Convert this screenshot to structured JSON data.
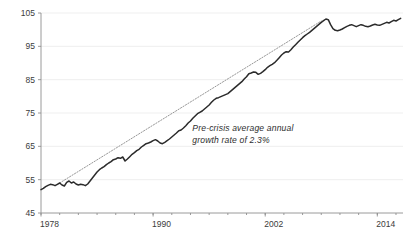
{
  "chart_data": {
    "type": "line",
    "title": "",
    "subtitle": "",
    "xlabel": "",
    "ylabel": "",
    "xlim": [
      1978,
      2016.75
    ],
    "ylim": [
      45,
      105
    ],
    "y_ticks": [
      45,
      55,
      65,
      75,
      85,
      95,
      105
    ],
    "y_tick_labels": [
      "45",
      "55",
      "65",
      "75",
      "85",
      "95",
      "105"
    ],
    "x_ticks": [
      1978,
      1990,
      2002,
      2014
    ],
    "x_tick_labels": [
      "1978",
      "1990",
      "2002",
      "2014"
    ],
    "x_minor_tick_interval": 2,
    "grid": "horizontal-faint",
    "legend": "none",
    "annotations": [
      {
        "name": "pre-crisis-trend-annotation",
        "line1": "Pre-crisis average annual",
        "line2": "growth rate of 2.3%",
        "x": 1994.2,
        "y": 69.5,
        "style": "italic"
      }
    ],
    "colors": {
      "series": "#2b2b2b",
      "trend": "#8a8a8a",
      "axis": "#8e8e8e",
      "grid": "#e8e8e8",
      "text": "#3b3b3b",
      "background": "#ffffff"
    },
    "series": [
      {
        "name": "index-series",
        "style": "solid",
        "color": "#2b2b2b",
        "x": [
          1978.0,
          1978.25,
          1978.5,
          1978.75,
          1979.0,
          1979.25,
          1979.5,
          1979.75,
          1980.0,
          1980.25,
          1980.5,
          1980.75,
          1981.0,
          1981.25,
          1981.5,
          1981.75,
          1982.0,
          1982.25,
          1982.5,
          1982.75,
          1983.0,
          1983.25,
          1983.5,
          1983.75,
          1984.0,
          1984.25,
          1984.5,
          1984.75,
          1985.0,
          1985.25,
          1985.5,
          1985.75,
          1986.0,
          1986.25,
          1986.5,
          1986.75,
          1987.0,
          1987.25,
          1987.5,
          1987.75,
          1988.0,
          1988.25,
          1988.5,
          1988.75,
          1989.0,
          1989.25,
          1989.5,
          1989.75,
          1990.0,
          1990.25,
          1990.5,
          1990.75,
          1991.0,
          1991.25,
          1991.5,
          1991.75,
          1992.0,
          1992.25,
          1992.5,
          1992.75,
          1993.0,
          1993.25,
          1993.5,
          1993.75,
          1994.0,
          1994.25,
          1994.5,
          1994.75,
          1995.0,
          1995.25,
          1995.5,
          1995.75,
          1996.0,
          1996.25,
          1996.5,
          1996.75,
          1997.0,
          1997.25,
          1997.5,
          1997.75,
          1998.0,
          1998.25,
          1998.5,
          1998.75,
          1999.0,
          1999.25,
          1999.5,
          1999.75,
          2000.0,
          2000.25,
          2000.5,
          2000.75,
          2001.0,
          2001.25,
          2001.5,
          2001.75,
          2002.0,
          2002.25,
          2002.5,
          2002.75,
          2003.0,
          2003.25,
          2003.5,
          2003.75,
          2004.0,
          2004.25,
          2004.5,
          2004.75,
          2005.0,
          2005.25,
          2005.5,
          2005.75,
          2006.0,
          2006.25,
          2006.5,
          2006.75,
          2007.0,
          2007.25,
          2007.5,
          2007.75,
          2008.0,
          2008.25,
          2008.5,
          2008.75,
          2009.0,
          2009.25,
          2009.5,
          2009.75,
          2010.0,
          2010.25,
          2010.5,
          2010.75,
          2011.0,
          2011.25,
          2011.5,
          2011.75,
          2012.0,
          2012.25,
          2012.5,
          2012.75,
          2013.0,
          2013.25,
          2013.5,
          2013.75,
          2014.0,
          2014.25,
          2014.5,
          2014.75,
          2015.0,
          2015.25,
          2015.5,
          2015.75,
          2016.0,
          2016.25,
          2016.5
        ],
        "y": [
          52.0,
          52.4,
          52.9,
          53.3,
          53.6,
          53.5,
          53.2,
          53.6,
          54.0,
          53.4,
          53.1,
          54.2,
          54.6,
          54.0,
          54.3,
          53.7,
          53.4,
          53.6,
          53.5,
          53.2,
          53.7,
          54.6,
          55.5,
          56.4,
          57.3,
          58.0,
          58.5,
          58.9,
          59.5,
          60.0,
          60.4,
          61.0,
          61.2,
          61.6,
          61.4,
          61.8,
          60.6,
          61.2,
          61.9,
          62.6,
          63.1,
          63.7,
          64.1,
          64.8,
          65.3,
          65.8,
          66.0,
          66.3,
          66.7,
          67.0,
          66.6,
          66.0,
          65.8,
          66.2,
          66.7,
          67.2,
          67.8,
          68.4,
          69.0,
          69.7,
          69.9,
          70.5,
          71.2,
          72.0,
          72.6,
          73.4,
          74.1,
          74.8,
          75.2,
          75.6,
          76.2,
          76.8,
          77.4,
          78.2,
          78.9,
          79.4,
          79.6,
          79.9,
          80.2,
          80.5,
          80.8,
          81.4,
          82.0,
          82.6,
          83.2,
          83.8,
          84.4,
          85.2,
          85.9,
          86.8,
          87.0,
          87.3,
          87.2,
          86.6,
          86.9,
          87.4,
          88.0,
          88.7,
          89.2,
          89.6,
          90.1,
          90.8,
          91.6,
          92.4,
          93.0,
          93.4,
          93.3,
          94.0,
          94.8,
          95.5,
          96.2,
          96.9,
          97.6,
          98.2,
          98.7,
          99.2,
          99.8,
          100.4,
          101.0,
          101.6,
          102.2,
          102.7,
          103.2,
          103.0,
          101.5,
          100.3,
          99.8,
          99.7,
          99.9,
          100.2,
          100.6,
          101.0,
          101.3,
          101.5,
          101.2,
          100.9,
          101.2,
          101.5,
          101.3,
          101.0,
          100.9,
          101.1,
          101.4,
          101.6,
          101.4,
          101.3,
          101.6,
          101.9,
          102.2,
          102.0,
          102.4,
          102.8,
          102.6,
          103.0,
          103.4
        ]
      }
    ],
    "trend": {
      "name": "pre-crisis-trend-line",
      "style": "dotted",
      "color": "#8a8a8a",
      "label": "Pre-crisis average annual growth rate of 2.3%",
      "growth_rate_percent": 2.3,
      "x_start": 1980.0,
      "y_start": 54.0,
      "x_end": 2008.0,
      "y_end": 102.6
    }
  }
}
